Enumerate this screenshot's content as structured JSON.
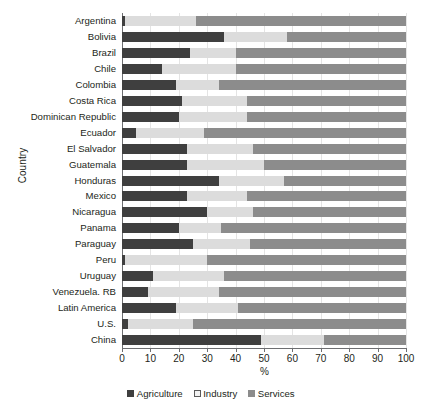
{
  "chart_data": {
    "type": "bar",
    "orientation": "horizontal",
    "stacked": true,
    "title": "",
    "xlabel": "%",
    "ylabel": "Country",
    "xlim": [
      0,
      100
    ],
    "xticks": [
      0,
      10,
      20,
      30,
      40,
      50,
      60,
      70,
      80,
      90,
      100
    ],
    "grid": true,
    "legend_position": "bottom",
    "categories": [
      "Argentina",
      "Bolivia",
      "Brazil",
      "Chile",
      "Colombia",
      "Costa Rica",
      "Dominican Republic",
      "Ecuador",
      "El Salvador",
      "Guatemala",
      "Honduras",
      "Mexico",
      "Nicaragua",
      "Panama",
      "Paraguay",
      "Peru",
      "Uruguay",
      "Venezuela. RB",
      "Latin America",
      "U.S.",
      "China"
    ],
    "series": [
      {
        "name": "Agriculture",
        "color": "#3f3f3f",
        "values": [
          1,
          36,
          24,
          14,
          19,
          21,
          20,
          5,
          23,
          23,
          34,
          23,
          30,
          20,
          25,
          1,
          11,
          9,
          19,
          2,
          49
        ]
      },
      {
        "name": "Industry",
        "color": "#dcdcdc",
        "values": [
          25,
          22,
          16,
          26,
          15,
          23,
          24,
          24,
          23,
          27,
          23,
          21,
          16,
          15,
          20,
          29,
          25,
          25,
          22,
          23,
          22
        ]
      },
      {
        "name": "Services",
        "color": "#8c8c8c",
        "values": [
          74,
          42,
          60,
          60,
          66,
          56,
          56,
          71,
          54,
          50,
          43,
          56,
          54,
          65,
          55,
          70,
          64,
          66,
          59,
          75,
          29
        ]
      }
    ]
  },
  "legend": {
    "items": [
      {
        "label": "Agriculture",
        "swatch": "agriculture"
      },
      {
        "label": "Industry",
        "swatch": "industry"
      },
      {
        "label": "Services",
        "swatch": "services"
      }
    ]
  }
}
